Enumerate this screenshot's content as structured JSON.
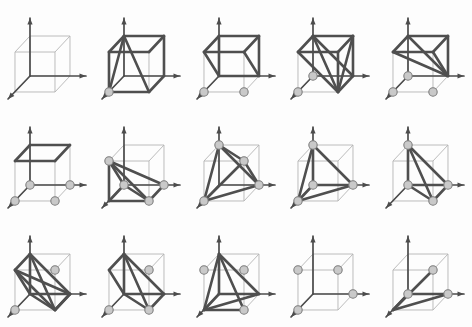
{
  "figure": {
    "type": "diagram-grid",
    "rows": 3,
    "columns": 5,
    "panel_count": 15,
    "colors": {
      "background": "#fdfdfd",
      "cube_edge": "#b4b4b4",
      "axis": "#4c4c4c",
      "polytope_edge": "#4f4f4f",
      "node_fill": "#c9c9c9",
      "node_stroke": "#7d7d7d"
    },
    "geometry": {
      "note": "Unit cube drawn in oblique projection with three coordinate axes (x to the right, y to the upper, z toward lower-left).",
      "cube_vertices": {
        "o": [
          30,
          76
        ],
        "x": [
          70,
          76
        ],
        "y": [
          30,
          36
        ],
        "xy": [
          70,
          36
        ],
        "z": [
          15,
          92
        ],
        "xz": [
          55,
          92
        ],
        "yz": [
          15,
          52
        ],
        "xyz": [
          55,
          52
        ]
      },
      "axes": [
        {
          "name": "y-axis",
          "from": "o",
          "to": [
            30,
            18
          ]
        },
        {
          "name": "x-axis",
          "from": "o",
          "to": [
            86,
            76
          ]
        },
        {
          "name": "z-axis",
          "from": "o",
          "to": [
            8,
            99
          ]
        }
      ]
    },
    "panels": [
      {
        "index": 1,
        "name": "panel-1",
        "row": 1,
        "column": 1,
        "description": "Empty cube, no highlighted polytope, no nodes",
        "highlighted_edges": [],
        "nodes": []
      },
      {
        "index": 2,
        "name": "panel-2",
        "row": 1,
        "column": 2,
        "description": "Polytope spanning top face and lower-front wedge",
        "highlighted_edges": [
          [
            "y",
            "xy"
          ],
          [
            "xy",
            "xyz"
          ],
          [
            "y",
            "yz"
          ],
          [
            "yz",
            "xyz"
          ],
          [
            "y",
            "z"
          ],
          [
            "y",
            "xz"
          ],
          [
            "z",
            "xz"
          ],
          [
            "xz",
            "x"
          ],
          [
            "x",
            "xy"
          ],
          [
            "yz",
            "z"
          ]
        ],
        "nodes": [
          "z"
        ]
      },
      {
        "index": 3,
        "name": "panel-3",
        "row": 1,
        "column": 3,
        "description": "Upper half-cube slab polytope",
        "highlighted_edges": [
          [
            "y",
            "xy"
          ],
          [
            "xy",
            "xyz"
          ],
          [
            "y",
            "yz"
          ],
          [
            "yz",
            "xyz"
          ],
          [
            "y",
            "o"
          ],
          [
            "o",
            "x"
          ],
          [
            "x",
            "xy"
          ],
          [
            "yz",
            "o"
          ],
          [
            "xyz",
            "x"
          ]
        ],
        "nodes": [
          "z",
          "xz"
        ]
      },
      {
        "index": 4,
        "name": "panel-4",
        "row": 1,
        "column": 4,
        "description": "Large tetrahedral hull touching five cube corners",
        "highlighted_edges": [
          [
            "y",
            "xy"
          ],
          [
            "xy",
            "xyz"
          ],
          [
            "y",
            "yz"
          ],
          [
            "yz",
            "xyz"
          ],
          [
            "y",
            "xz"
          ],
          [
            "xy",
            "xz"
          ],
          [
            "xyz",
            "xz"
          ],
          [
            "y",
            "x"
          ],
          [
            "x",
            "xz"
          ],
          [
            "x",
            "xy"
          ],
          [
            "yz",
            "xz"
          ]
        ],
        "nodes": [
          "o",
          "z"
        ]
      },
      {
        "index": 5,
        "name": "panel-5",
        "row": 1,
        "column": 5,
        "description": "Top face with diagonals down to front-right corner",
        "highlighted_edges": [
          [
            "y",
            "xy"
          ],
          [
            "xy",
            "xyz"
          ],
          [
            "y",
            "yz"
          ],
          [
            "yz",
            "xyz"
          ],
          [
            "y",
            "x"
          ],
          [
            "yz",
            "x"
          ],
          [
            "xy",
            "x"
          ],
          [
            "xyz",
            "x"
          ]
        ],
        "nodes": [
          "z",
          "xz",
          "o"
        ]
      },
      {
        "index": 6,
        "name": "panel-6",
        "row": 2,
        "column": 1,
        "description": "Top face highlighted only",
        "highlighted_edges": [
          [
            "y",
            "xy"
          ],
          [
            "xy",
            "xyz"
          ],
          [
            "y",
            "yz"
          ],
          [
            "yz",
            "xyz"
          ]
        ],
        "nodes": [
          "o",
          "x",
          "z",
          "xz"
        ]
      },
      {
        "index": 7,
        "name": "panel-7",
        "row": 2,
        "column": 2,
        "description": "Fan of edges from upper-back-left corner to bottom vertices",
        "highlighted_edges": [
          [
            "yz",
            "o"
          ],
          [
            "yz",
            "x"
          ],
          [
            "yz",
            "xz"
          ],
          [
            "yz",
            "z"
          ],
          [
            "o",
            "xz"
          ],
          [
            "xz",
            "x"
          ],
          [
            "z",
            "xz"
          ],
          [
            "o",
            "z"
          ]
        ],
        "nodes": [
          "yz",
          "o",
          "x",
          "xz"
        ]
      },
      {
        "index": 8,
        "name": "panel-8",
        "row": 2,
        "column": 3,
        "description": "Tetrahedron on alternating vertices",
        "highlighted_edges": [
          [
            "y",
            "xyz"
          ],
          [
            "y",
            "z"
          ],
          [
            "y",
            "x"
          ],
          [
            "xyz",
            "z"
          ],
          [
            "xyz",
            "x"
          ],
          [
            "z",
            "x"
          ]
        ],
        "nodes": [
          "y",
          "xyz",
          "z",
          "x"
        ]
      },
      {
        "index": 9,
        "name": "panel-9",
        "row": 2,
        "column": 4,
        "description": "Tetrahedron on front-left-top vertices",
        "highlighted_edges": [
          [
            "y",
            "o"
          ],
          [
            "y",
            "z"
          ],
          [
            "y",
            "x"
          ],
          [
            "o",
            "z"
          ],
          [
            "o",
            "x"
          ],
          [
            "z",
            "x"
          ]
        ],
        "nodes": [
          "y",
          "o",
          "z",
          "x"
        ]
      },
      {
        "index": 10,
        "name": "panel-10",
        "row": 2,
        "column": 5,
        "description": "Tetrahedron on bottom-front triangle plus apex",
        "highlighted_edges": [
          [
            "y",
            "o"
          ],
          [
            "y",
            "xz"
          ],
          [
            "y",
            "x"
          ],
          [
            "o",
            "xz"
          ],
          [
            "o",
            "x"
          ],
          [
            "xz",
            "x"
          ]
        ],
        "nodes": [
          "y",
          "o",
          "xz",
          "x"
        ]
      },
      {
        "index": 11,
        "name": "panel-11",
        "row": 3,
        "column": 1,
        "description": "Octahedron-like hull on six vertices",
        "highlighted_edges": [
          [
            "y",
            "yz"
          ],
          [
            "y",
            "o"
          ],
          [
            "y",
            "x"
          ],
          [
            "y",
            "xz"
          ],
          [
            "yz",
            "o"
          ],
          [
            "yz",
            "xz"
          ],
          [
            "o",
            "x"
          ],
          [
            "o",
            "xz"
          ],
          [
            "x",
            "xz"
          ],
          [
            "yz",
            "x"
          ],
          [
            "xz",
            "x"
          ]
        ],
        "nodes": [
          "xyz",
          "z"
        ]
      },
      {
        "index": 12,
        "name": "panel-12",
        "row": 3,
        "column": 2,
        "description": "Hull over left face and front-lower edges",
        "highlighted_edges": [
          [
            "y",
            "yz"
          ],
          [
            "y",
            "o"
          ],
          [
            "y",
            "x"
          ],
          [
            "yz",
            "o"
          ],
          [
            "o",
            "x"
          ],
          [
            "y",
            "xz"
          ],
          [
            "o",
            "xz"
          ],
          [
            "xz",
            "x"
          ]
        ],
        "nodes": [
          "xyz",
          "z",
          "xz"
        ]
      },
      {
        "index": 13,
        "name": "panel-13",
        "row": 3,
        "column": 3,
        "description": "Hull with crossing diagonals on the front face",
        "highlighted_edges": [
          [
            "y",
            "z"
          ],
          [
            "y",
            "x"
          ],
          [
            "y",
            "o"
          ],
          [
            "z",
            "x"
          ],
          [
            "z",
            "o"
          ],
          [
            "o",
            "x"
          ],
          [
            "y",
            "xz"
          ],
          [
            "z",
            "xz"
          ]
        ],
        "nodes": [
          "xyz",
          "yz",
          "xz"
        ]
      },
      {
        "index": 14,
        "name": "panel-14",
        "row": 3,
        "column": 4,
        "description": "Plain cube with four marked vertices, no highlighted edges",
        "highlighted_edges": [],
        "nodes": [
          "xyz",
          "yz",
          "x",
          "z"
        ]
      },
      {
        "index": 15,
        "name": "panel-15",
        "row": 3,
        "column": 5,
        "description": "Main space diagonal highlighted from back-top-right to front-bottom-left",
        "highlighted_edges": [
          [
            "xyz",
            "z"
          ],
          [
            "z",
            "x"
          ],
          [
            "z",
            "o"
          ],
          [
            "o",
            "x"
          ]
        ],
        "nodes": [
          "xyz",
          "o",
          "x"
        ]
      }
    ]
  }
}
